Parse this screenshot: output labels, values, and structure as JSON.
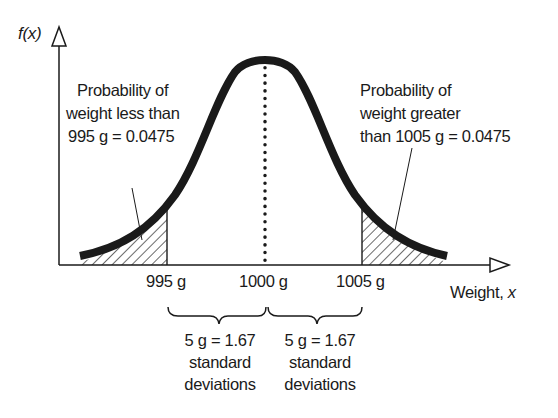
{
  "diagram": {
    "type": "normal-distribution",
    "y_axis_label_fn": "f(",
    "y_axis_label_var": "x",
    "y_axis_label_close": ")",
    "x_axis_label_text": "Weight, ",
    "x_axis_label_var": "x",
    "mean": 1000,
    "unit": "g",
    "tick_labels": [
      "995 g",
      "1000 g",
      "1005 g"
    ],
    "left_annotation": {
      "lines": [
        "Probability of",
        "weight less than",
        "995 g = 0.0475"
      ]
    },
    "right_annotation": {
      "lines": [
        "Probability of",
        "weight greater",
        "than 1005 g = 0.0475"
      ]
    },
    "left_brace": {
      "lines": [
        "5 g = 1.67",
        "standard",
        "deviations"
      ]
    },
    "right_brace": {
      "lines": [
        "5 g = 1.67",
        "standard",
        "deviations"
      ]
    },
    "colors": {
      "ink": "#1a1a1a",
      "background": "#ffffff"
    }
  }
}
